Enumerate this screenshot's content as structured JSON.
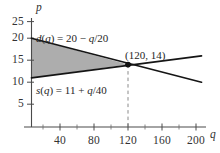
{
  "chart_data": {
    "type": "line",
    "title": "",
    "xlabel": "q",
    "ylabel": "p",
    "xlim": [
      0,
      210
    ],
    "ylim": [
      0,
      27
    ],
    "grid": false,
    "legend": "none",
    "xticks": [
      40,
      80,
      120,
      160,
      200
    ],
    "yticks": [
      25,
      20,
      15,
      10,
      5
    ],
    "xtick_labels": [
      "40",
      "80",
      "120",
      "160",
      "200"
    ],
    "ytick_labels": [
      "25",
      "20",
      "15",
      "10",
      "5"
    ],
    "series": [
      {
        "name": "d(q) = 20 - q/20",
        "label_text_html": "<i>d</i>(<i>q</i>) = 20 − <i>q</i>/20",
        "label_plain": "d(q) = 20 − q/20",
        "type": "line",
        "color": "#1a1a1a",
        "slope": -0.05,
        "intercept": 20,
        "x": [
          0,
          200
        ],
        "values": [
          20,
          10
        ]
      },
      {
        "name": "s(q) = 11 + q/40",
        "label_text_html": "<i>s</i>(<i>q</i>) = 11 + <i>q</i>/40",
        "label_plain": "s(q) = 11 + q/40",
        "type": "line",
        "color": "#1a1a1a",
        "slope": 0.025,
        "intercept": 11,
        "x": [
          0,
          200
        ],
        "values": [
          11,
          16
        ]
      }
    ],
    "annotations": [
      {
        "name": "equilibrium-point",
        "text": "(120, 14)",
        "x": 120,
        "y": 14,
        "marker": "filled-circle",
        "marker_color": "#111111",
        "dashed_dropline": true
      }
    ],
    "shaded_region": {
      "name": "consumer-producer-surplus",
      "description": "region between d(q) and s(q) from q=0 to q=120",
      "fill_color": "#a8a8a8",
      "x_range": [
        0,
        120
      ]
    }
  },
  "axis": {
    "y_name": "p",
    "x_name": "q"
  },
  "labels": {
    "demand": "d(q) = 20 − q/20",
    "supply": "s(q) = 11 + q/40",
    "point": "(120, 14)"
  },
  "ticks": {
    "y": [
      "25",
      "20",
      "15",
      "10",
      "5"
    ],
    "x": [
      "40",
      "80",
      "120",
      "160",
      "200"
    ]
  }
}
